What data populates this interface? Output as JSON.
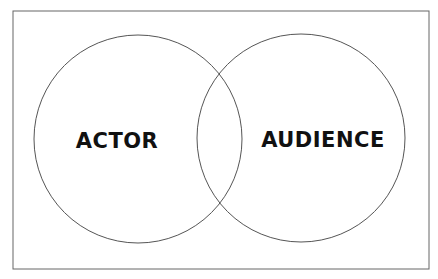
{
  "diagram": {
    "type": "venn",
    "sets": [
      {
        "label": "ACTOR"
      },
      {
        "label": "AUDIENCE"
      }
    ],
    "colors": {
      "stroke": "#555555",
      "frame": "#666666",
      "text": "#111111",
      "background": "#ffffff"
    }
  }
}
